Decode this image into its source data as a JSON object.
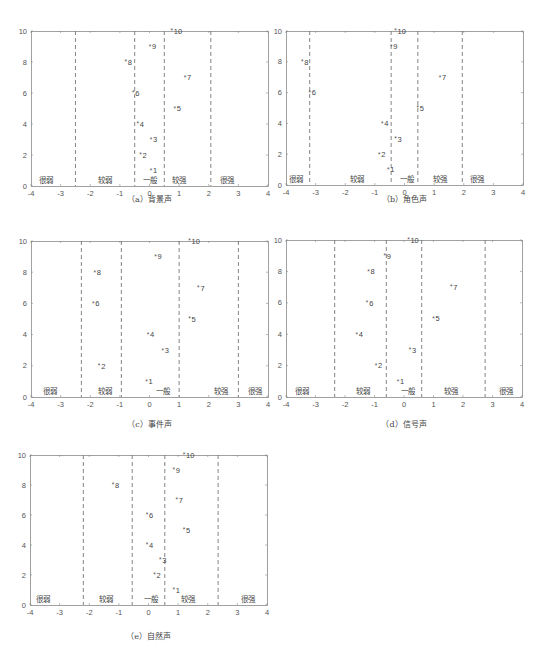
{
  "chart_data": [
    {
      "id": "a",
      "type": "scatter",
      "title": "（a）背景声",
      "caption": "（a）背景声",
      "xlim": [
        -4,
        4
      ],
      "ylim": [
        0,
        10
      ],
      "xticks": [
        -4,
        -3,
        -2,
        -1,
        0,
        1,
        2,
        3,
        4
      ],
      "yticks": [
        0,
        2,
        4,
        6,
        8,
        10
      ],
      "thresholds": [
        -2.5,
        -0.5,
        0.5,
        2.07
      ],
      "region_labels": [
        {
          "text": "很弱",
          "x": -3.5
        },
        {
          "text": "较弱",
          "x": -1.5
        },
        {
          "text": "一般",
          "x": 0.0
        },
        {
          "text": "较强",
          "x": 1.0
        },
        {
          "text": "很强",
          "x": 2.6
        }
      ],
      "points": [
        {
          "label": "1",
          "x": 0.05,
          "y": 1
        },
        {
          "label": "2",
          "x": -0.3,
          "y": 2
        },
        {
          "label": "3",
          "x": 0.05,
          "y": 3
        },
        {
          "label": "4",
          "x": -0.4,
          "y": 4
        },
        {
          "label": "5",
          "x": 0.85,
          "y": 5
        },
        {
          "label": "6",
          "x": -0.55,
          "y": 6
        },
        {
          "label": "7",
          "x": 1.2,
          "y": 7
        },
        {
          "label": "8",
          "x": -0.8,
          "y": 8
        },
        {
          "label": "9",
          "x": 0.02,
          "y": 9
        },
        {
          "label": "10",
          "x": 0.75,
          "y": 10
        }
      ]
    },
    {
      "id": "b",
      "type": "scatter",
      "title": "（b）角色声",
      "caption": "（b）角色声",
      "xlim": [
        -4,
        4
      ],
      "ylim": [
        0,
        10
      ],
      "xticks": [
        -4,
        -3,
        -2,
        -1,
        0,
        1,
        2,
        3,
        4
      ],
      "yticks": [
        0,
        2,
        4,
        6,
        8,
        10
      ],
      "thresholds": [
        -3.2,
        -0.45,
        0.45,
        1.95
      ],
      "region_labels": [
        {
          "text": "很弱",
          "x": -3.65
        },
        {
          "text": "较弱",
          "x": -1.6
        },
        {
          "text": "一般",
          "x": 0.1
        },
        {
          "text": "较强",
          "x": 1.2
        },
        {
          "text": "很强",
          "x": 2.45
        }
      ],
      "points": [
        {
          "label": "1",
          "x": -0.55,
          "y": 1
        },
        {
          "label": "2",
          "x": -0.85,
          "y": 2
        },
        {
          "label": "3",
          "x": -0.3,
          "y": 3
        },
        {
          "label": "4",
          "x": -0.75,
          "y": 4
        },
        {
          "label": "5",
          "x": 0.45,
          "y": 5
        },
        {
          "label": "6",
          "x": -3.2,
          "y": 6
        },
        {
          "label": "7",
          "x": 1.2,
          "y": 7
        },
        {
          "label": "8",
          "x": -3.45,
          "y": 8
        },
        {
          "label": "9",
          "x": -0.45,
          "y": 9
        },
        {
          "label": "10",
          "x": -0.3,
          "y": 10
        }
      ]
    },
    {
      "id": "c",
      "type": "scatter",
      "title": "（c）事件声",
      "caption": "（c）事件声",
      "xlim": [
        -4,
        4
      ],
      "ylim": [
        0,
        10
      ],
      "xticks": [
        -4,
        -3,
        -2,
        -1,
        0,
        1,
        2,
        3,
        4
      ],
      "yticks": [
        0,
        2,
        4,
        6,
        8,
        10
      ],
      "thresholds": [
        -2.3,
        -0.95,
        1.0,
        3.0
      ],
      "region_labels": [
        {
          "text": "很弱",
          "x": -3.35
        },
        {
          "text": "较弱",
          "x": -1.5
        },
        {
          "text": "一般",
          "x": 0.45
        },
        {
          "text": "较强",
          "x": 2.4
        },
        {
          "text": "很强",
          "x": 3.55
        }
      ],
      "points": [
        {
          "label": "1",
          "x": -0.1,
          "y": 1
        },
        {
          "label": "2",
          "x": -1.7,
          "y": 2
        },
        {
          "label": "3",
          "x": 0.45,
          "y": 3
        },
        {
          "label": "4",
          "x": -0.05,
          "y": 4
        },
        {
          "label": "5",
          "x": 1.35,
          "y": 5
        },
        {
          "label": "6",
          "x": -1.9,
          "y": 6
        },
        {
          "label": "7",
          "x": 1.65,
          "y": 7
        },
        {
          "label": "8",
          "x": -1.85,
          "y": 8
        },
        {
          "label": "9",
          "x": 0.2,
          "y": 9
        },
        {
          "label": "10",
          "x": 1.35,
          "y": 10
        }
      ]
    },
    {
      "id": "d",
      "type": "scatter",
      "title": "（d）信号声",
      "caption": "（d）信号声",
      "xlim": [
        -4,
        4
      ],
      "ylim": [
        0,
        10
      ],
      "xticks": [
        -4,
        -3,
        -2,
        -1,
        0,
        1,
        2,
        3,
        4
      ],
      "yticks": [
        0,
        2,
        4,
        6,
        8,
        10
      ],
      "thresholds": [
        -2.35,
        -0.6,
        0.6,
        2.75
      ],
      "region_labels": [
        {
          "text": "很弱",
          "x": -3.45
        },
        {
          "text": "较弱",
          "x": -1.4
        },
        {
          "text": "一般",
          "x": 0.15
        },
        {
          "text": "较强",
          "x": 1.6
        },
        {
          "text": "很强",
          "x": 3.45
        }
      ],
      "points": [
        {
          "label": "1",
          "x": -0.2,
          "y": 1
        },
        {
          "label": "2",
          "x": -0.95,
          "y": 2
        },
        {
          "label": "3",
          "x": 0.2,
          "y": 3
        },
        {
          "label": "4",
          "x": -1.6,
          "y": 4
        },
        {
          "label": "5",
          "x": 1.0,
          "y": 5
        },
        {
          "label": "6",
          "x": -1.25,
          "y": 6
        },
        {
          "label": "7",
          "x": 1.6,
          "y": 7
        },
        {
          "label": "8",
          "x": -1.2,
          "y": 8
        },
        {
          "label": "9",
          "x": -0.65,
          "y": 9
        },
        {
          "label": "10",
          "x": 0.15,
          "y": 10
        }
      ]
    },
    {
      "id": "e",
      "type": "scatter",
      "title": "（e）自然声",
      "caption": "（e）自然声",
      "xlim": [
        -4,
        4
      ],
      "ylim": [
        0,
        10
      ],
      "xticks": [
        -4,
        -3,
        -2,
        -1,
        0,
        1,
        2,
        3,
        4
      ],
      "yticks": [
        0,
        2,
        4,
        6,
        8,
        10
      ],
      "thresholds": [
        -2.2,
        -0.55,
        0.55,
        2.35
      ],
      "region_labels": [
        {
          "text": "很弱",
          "x": -3.55
        },
        {
          "text": "较弱",
          "x": -1.45
        },
        {
          "text": "一般",
          "x": 0.1
        },
        {
          "text": "较强",
          "x": 1.35
        },
        {
          "text": "很强",
          "x": 3.35
        }
      ],
      "points": [
        {
          "label": "1",
          "x": 0.85,
          "y": 1
        },
        {
          "label": "2",
          "x": 0.2,
          "y": 2
        },
        {
          "label": "3",
          "x": 0.4,
          "y": 3
        },
        {
          "label": "4",
          "x": -0.05,
          "y": 4
        },
        {
          "label": "5",
          "x": 1.2,
          "y": 5
        },
        {
          "label": "6",
          "x": -0.05,
          "y": 6
        },
        {
          "label": "7",
          "x": 0.95,
          "y": 7
        },
        {
          "label": "8",
          "x": -1.2,
          "y": 8
        },
        {
          "label": "9",
          "x": 0.85,
          "y": 9
        },
        {
          "label": "10",
          "x": 1.2,
          "y": 10
        }
      ]
    }
  ],
  "colors": {
    "axis": "#8a8a8a",
    "tick_text": "#555555",
    "threshold_line": "#777777",
    "marker": "#555555",
    "point_label": "#444444",
    "region_label": "#444444",
    "caption": "#444444"
  }
}
